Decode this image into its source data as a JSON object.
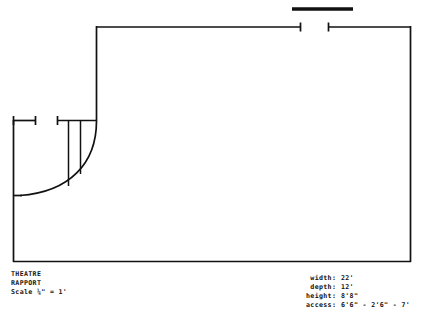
{
  "document": {
    "kind": "theatre-venue-floor-plan",
    "title_block": {
      "line1": "THEATRE",
      "line2": "RAPPORT",
      "line3": "Scale ¼\" = 1'"
    },
    "specs": {
      "rows": [
        {
          "label": "width",
          "separator": ":",
          "value": "22'"
        },
        {
          "label": "depth",
          "separator": ":",
          "value": "12'"
        },
        {
          "label": "height",
          "separator": ":",
          "value": "8'8\""
        },
        {
          "label": "access",
          "separator": ":",
          "value": "6'6\" - 2'6\" - 7'"
        }
      ]
    }
  },
  "colors": {
    "ink": "#111111",
    "paper": "#ffffff"
  },
  "plan": {
    "outer_border": {
      "left": 13,
      "top": 26,
      "right": 411,
      "bottom": 262
    },
    "top_bar": {
      "x1": 292,
      "x2": 353,
      "y": 9,
      "thickness": 3.5
    },
    "walls": {
      "top_wall_left": {
        "x1": 96,
        "x2": 301,
        "y": 27
      },
      "top_wall_right": {
        "x1": 328,
        "x2": 411,
        "y": 27
      },
      "right_wall": {
        "x": 411,
        "y1": 27,
        "y2": 262
      },
      "bottom_wall": {
        "x1": 13,
        "x2": 411,
        "y": 262
      },
      "left_wall": {
        "x": 13,
        "y1": 120,
        "y2": 262
      },
      "upper_left_stub": {
        "x1": 13,
        "x2": 36,
        "y": 120
      },
      "mid_wall": {
        "x1": 57,
        "x2": 96,
        "y": 120
      },
      "stage_right_wall": {
        "x": 96,
        "y1": 27,
        "y2": 120
      }
    },
    "partitions": [
      {
        "x": 68,
        "y1": 120,
        "y2": 185
      },
      {
        "x": 80,
        "y1": 120,
        "y2": 172
      }
    ],
    "curve": {
      "from_x": 96,
      "from_y": 120,
      "to_x": 20,
      "to_y": 196,
      "note": "curved apron / raked seating edge"
    },
    "door_gap_top": {
      "x1": 301,
      "x2": 328,
      "y": 27
    }
  }
}
